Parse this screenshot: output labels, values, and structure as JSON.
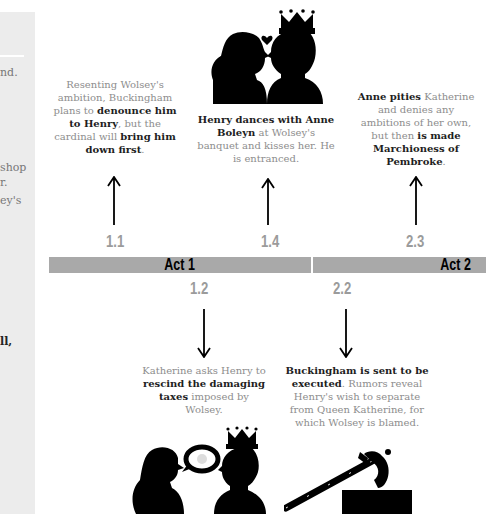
{
  "side_panel": {
    "fragments": [
      {
        "text": "nd.",
        "bold": false
      },
      {
        "text": "shop",
        "bold": false
      },
      {
        "text": "r.",
        "bold": false
      },
      {
        "text": "ey's",
        "bold": false
      },
      {
        "text": "ll,",
        "bold": true
      }
    ]
  },
  "timeline": {
    "acts": [
      {
        "label": "Act 1"
      },
      {
        "label": "Act 2"
      }
    ],
    "events_above": [
      {
        "scene": "1.1",
        "segments": [
          {
            "text": "Resenting Wolsey's ambition, Buckingham plans to ",
            "bold": false
          },
          {
            "text": "denounce him to Henry",
            "bold": true
          },
          {
            "text": ", but the cardinal will ",
            "bold": false
          },
          {
            "text": "bring him down first",
            "bold": true
          },
          {
            "text": ".",
            "bold": false
          }
        ],
        "icon": null
      },
      {
        "scene": "1.4",
        "segments": [
          {
            "text": "Henry dances with Anne Boleyn",
            "bold": true
          },
          {
            "text": " at Wolsey's banquet and kisses her. He is entranced.",
            "bold": false
          }
        ],
        "icon": "henry-kissing-anne-icon"
      },
      {
        "scene": "2.3",
        "segments": [
          {
            "text": "Anne pities",
            "bold": true
          },
          {
            "text": " Katherine and denies any ambitions of her own, but then ",
            "bold": false
          },
          {
            "text": "is made Marchioness of Pembroke",
            "bold": true
          },
          {
            "text": ".",
            "bold": false
          }
        ],
        "icon": null
      }
    ],
    "events_below": [
      {
        "scene": "1.2",
        "segments": [
          {
            "text": "Katherine asks Henry to ",
            "bold": false
          },
          {
            "text": "rescind the damaging taxes",
            "bold": true
          },
          {
            "text": " imposed by Wolsey.",
            "bold": false
          }
        ],
        "icon": "katherine-speaking-to-henry-icon"
      },
      {
        "scene": "2.2",
        "segments": [
          {
            "text": "Buckingham is sent to be executed",
            "bold": true
          },
          {
            "text": ". Rumors reveal Henry's wish to separate from Queen Katherine, for which Wolsey is blamed.",
            "bold": false
          }
        ],
        "icon": "executioner-axe-icon"
      }
    ]
  },
  "colors": {
    "bar": "#a9a9a9",
    "scene_number": "#9b9b9b",
    "side_panel": "#ececec",
    "body_text": "#8d8d8d",
    "bold_text": "#1e1e1e"
  }
}
